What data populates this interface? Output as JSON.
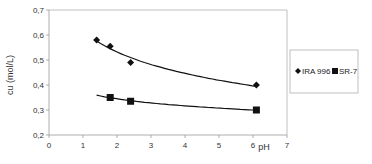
{
  "chart_data": {
    "type": "scatter",
    "title": "",
    "xlabel": "pH",
    "ylabel": "cu   (mol/L)",
    "xlim": [
      0,
      7
    ],
    "ylim": [
      0.2,
      0.7
    ],
    "x_ticks": [
      "0",
      "1",
      "2",
      "3",
      "4",
      "5",
      "6",
      "7"
    ],
    "y_ticks": [
      "0,2",
      "0,3",
      "0,4",
      "0,5",
      "0,6",
      "0,7"
    ],
    "grid": false,
    "legend_position": "right",
    "series": [
      {
        "name": "IRA 996",
        "marker": "diamond",
        "trendline": true,
        "points": [
          {
            "x": 1.4,
            "y": 0.58
          },
          {
            "x": 1.8,
            "y": 0.555
          },
          {
            "x": 2.4,
            "y": 0.49
          },
          {
            "x": 6.1,
            "y": 0.4
          }
        ]
      },
      {
        "name": "SR-7",
        "marker": "square",
        "trendline": true,
        "points": [
          {
            "x": 1.8,
            "y": 0.35
          },
          {
            "x": 2.4,
            "y": 0.335
          },
          {
            "x": 6.1,
            "y": 0.3
          }
        ],
        "trend_start": {
          "x": 1.4,
          "y": 0.36
        }
      }
    ]
  },
  "legend": {
    "items": [
      {
        "label": "IRA 996",
        "marker": "diamond"
      },
      {
        "label": "SR-7",
        "marker": "square"
      }
    ]
  },
  "colors": {
    "axis": "#9a9a9a",
    "frame": "#b0b0b0",
    "series": "#111111",
    "text": "#333333"
  }
}
